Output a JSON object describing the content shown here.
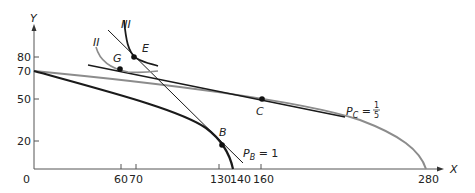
{
  "axes": {
    "x_label": "X",
    "y_label": "Y",
    "origin_label": "0",
    "x_ticks": [
      "60",
      "70",
      "130",
      "140",
      "160",
      "280"
    ],
    "y_ticks": [
      "80",
      "70",
      "50",
      "20"
    ]
  },
  "points": {
    "G": "G",
    "E": "E",
    "C": "C",
    "B": "B"
  },
  "curves": {
    "II": "II",
    "III": "III"
  },
  "price_labels": {
    "pb_main": "P",
    "pb_sub": "B",
    "pb_rest": " = 1",
    "pc_main": "P",
    "pc_sub": "C",
    "pc_eq": " = ",
    "pc_num": "1",
    "pc_den": "5"
  },
  "colors": {
    "black_curve": "#1a1a1a",
    "gray_curve": "#8c8c8c",
    "axis": "#555555"
  }
}
